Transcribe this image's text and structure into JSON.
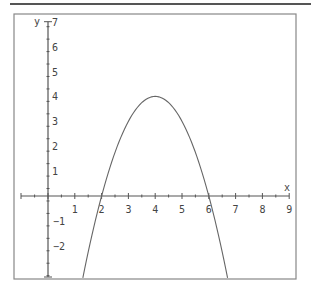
{
  "chart_data": {
    "type": "line",
    "title": "",
    "xlabel": "x",
    "ylabel": "y",
    "xlim": [
      -1,
      9
    ],
    "ylim": [
      -3.3,
      7
    ],
    "x_ticks": [
      1,
      2,
      3,
      4,
      5,
      6,
      7,
      8,
      9
    ],
    "y_ticks": [
      7,
      6,
      5,
      4,
      3,
      2,
      1,
      -1,
      -2
    ],
    "grid": false,
    "legend": null,
    "series": [
      {
        "name": "y = -(x-2)(x-6)",
        "equation": "y = -x^2 + 8x - 12",
        "x": [
          1.3,
          1.5,
          2,
          2.5,
          3,
          3.5,
          4,
          4.5,
          5,
          5.5,
          6,
          6.5,
          6.7
        ],
        "y": [
          -3.19,
          -1.75,
          0,
          1.75,
          3,
          3.75,
          4,
          3.75,
          3,
          1.75,
          0,
          -1.75,
          -3.19
        ]
      }
    ],
    "annotations": {
      "vertex": [
        4,
        4
      ],
      "roots": [
        2,
        6
      ]
    }
  },
  "colors": {
    "axis": "#555555",
    "curve": "#666666",
    "border": "#777777",
    "background": "#ffffff"
  }
}
